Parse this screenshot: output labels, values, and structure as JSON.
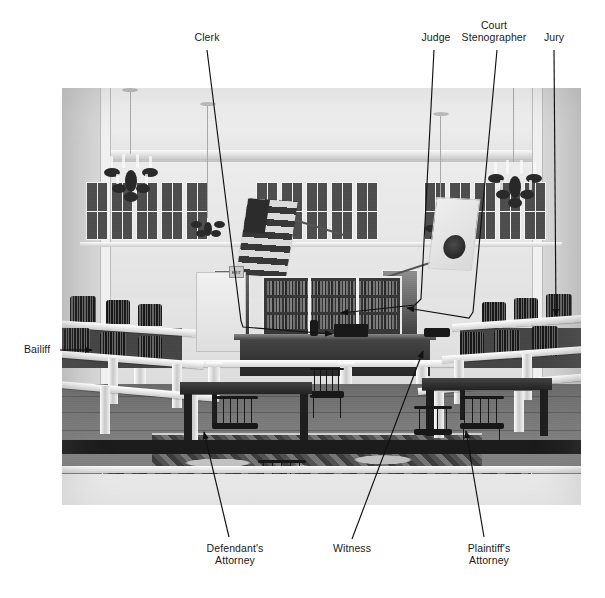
{
  "figure": {
    "type": "annotated-photograph",
    "photo": {
      "description": "Black and white photograph of a historic courtroom interior",
      "elements": [
        "coffered ceiling",
        "crown cornice",
        "clerestory window band",
        "two crystal chandeliers",
        "small central chandelier",
        "American flag",
        "state flag with seal",
        "EXIT sign",
        "law-book bookcase",
        "judge's bench",
        "white balustrade rail",
        "tiered jury box",
        "oriental rug",
        "attorney tables",
        "windsor chairs"
      ]
    }
  },
  "labels": {
    "clerk": {
      "text": "Clerk"
    },
    "judge": {
      "text": "Judge"
    },
    "stenographer": {
      "text": "Court\nStenographer"
    },
    "jury": {
      "text": "Jury"
    },
    "bailiff": {
      "text": "Bailiff"
    },
    "defendant": {
      "text": "Defendant's\nAttorney"
    },
    "witness": {
      "text": "Witness"
    },
    "plaintiff": {
      "text": "Plaintiff's\nAttorney"
    },
    "exit_sign": {
      "text": "EXIT"
    }
  },
  "colors": {
    "page_background": "#ffffff",
    "label_text": "#1a1a1a",
    "leader_line": "#111111",
    "photo_base": "#d9d9d6"
  },
  "leader_lines": [
    {
      "name": "clerk-leader",
      "style": "polyline-with-arrow",
      "target": "clerk's desk at center of bench"
    },
    {
      "name": "judge-leader",
      "style": "polyline-with-arrow",
      "target": "judge's bench seat"
    },
    {
      "name": "stenographer-leader",
      "style": "polyline-with-arrow",
      "target": "stenographer position beside bench"
    },
    {
      "name": "jury-leader",
      "style": "straight-with-arrow",
      "target": "jury box at right"
    },
    {
      "name": "bailiff-leader",
      "style": "straight-with-arrow",
      "target": "bailiff chair at left"
    },
    {
      "name": "defendant-leader",
      "style": "straight-with-arrow",
      "target": "defendant's attorney table, left foreground"
    },
    {
      "name": "witness-leader",
      "style": "straight-with-arrow",
      "target": "witness stand right of bench"
    },
    {
      "name": "plaintiff-leader",
      "style": "straight-with-arrow",
      "target": "plaintiff's attorney table, right foreground"
    }
  ]
}
